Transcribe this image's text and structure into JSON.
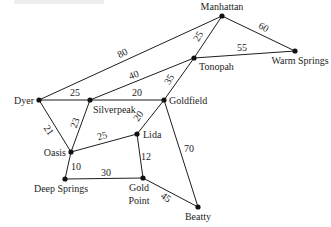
{
  "diagram": {
    "type": "weighted-undirected-graph",
    "nodes": [
      {
        "id": "manhattan",
        "label": "Manhattan",
        "x": 222,
        "y": 16,
        "lx": 222,
        "ly": 10,
        "anchor": "middle"
      },
      {
        "id": "tonopah",
        "label": "Tonopah",
        "x": 194,
        "y": 58,
        "lx": 199,
        "ly": 70,
        "anchor": "start"
      },
      {
        "id": "warm-springs",
        "label": "Warm Springs",
        "x": 295,
        "y": 51,
        "lx": 300,
        "ly": 64,
        "anchor": "middle"
      },
      {
        "id": "dyer",
        "label": "Dyer",
        "x": 39,
        "y": 100,
        "lx": 34,
        "ly": 104,
        "anchor": "end"
      },
      {
        "id": "silverpeak",
        "label": "Silverpeak",
        "x": 90,
        "y": 100,
        "lx": 93,
        "ly": 113,
        "anchor": "start"
      },
      {
        "id": "goldfield",
        "label": "Goldfield",
        "x": 164,
        "y": 100,
        "lx": 169,
        "ly": 104,
        "anchor": "start"
      },
      {
        "id": "lida",
        "label": "Lida",
        "x": 137,
        "y": 134,
        "lx": 143,
        "ly": 138,
        "anchor": "start"
      },
      {
        "id": "oasis",
        "label": "Oasis",
        "x": 71,
        "y": 152,
        "lx": 66,
        "ly": 156,
        "anchor": "end"
      },
      {
        "id": "deep-springs",
        "label": "Deep Springs",
        "x": 65,
        "y": 179,
        "lx": 61,
        "ly": 192,
        "anchor": "middle"
      },
      {
        "id": "gold-point",
        "label": "Gold",
        "label2": "Point",
        "x": 143,
        "y": 178,
        "lx": 139,
        "ly": 191,
        "lx2": 139,
        "ly2": 204,
        "anchor": "middle"
      },
      {
        "id": "beatty",
        "label": "Beatty",
        "x": 198,
        "y": 207,
        "lx": 198,
        "ly": 220,
        "anchor": "middle"
      }
    ],
    "edges": [
      {
        "from": "dyer",
        "to": "manhattan",
        "weight": "80",
        "wx": 124,
        "wy": 56,
        "rot": -28
      },
      {
        "from": "silverpeak",
        "to": "tonopah",
        "weight": "40",
        "wx": 135,
        "wy": 78,
        "rot": -22
      },
      {
        "from": "dyer",
        "to": "silverpeak",
        "weight": "25",
        "wx": 75,
        "wy": 96,
        "rot": 0
      },
      {
        "from": "silverpeak",
        "to": "goldfield",
        "weight": "20",
        "wx": 137,
        "wy": 96,
        "rot": 0
      },
      {
        "from": "manhattan",
        "to": "tonopah",
        "weight": "25",
        "wx": 201,
        "wy": 38,
        "rot": -60
      },
      {
        "from": "manhattan",
        "to": "warm-springs",
        "weight": "60",
        "wx": 262,
        "wy": 30,
        "rot": 30
      },
      {
        "from": "tonopah",
        "to": "warm-springs",
        "weight": "55",
        "wx": 242,
        "wy": 51,
        "rot": 0
      },
      {
        "from": "tonopah",
        "to": "goldfield",
        "weight": "35",
        "wx": 172,
        "wy": 81,
        "rot": -60
      },
      {
        "from": "dyer",
        "to": "oasis",
        "weight": "21",
        "wx": 46,
        "wy": 132,
        "rot": 55
      },
      {
        "from": "silverpeak",
        "to": "oasis",
        "weight": "23",
        "wx": 78,
        "wy": 124,
        "rot": -70
      },
      {
        "from": "oasis",
        "to": "lida",
        "weight": "25",
        "wx": 103,
        "wy": 139,
        "rot": -15
      },
      {
        "from": "goldfield",
        "to": "lida",
        "weight": "20",
        "wx": 141,
        "wy": 118,
        "rot": -55
      },
      {
        "from": "goldfield",
        "to": "beatty",
        "weight": "70",
        "wx": 189,
        "wy": 152,
        "rot": 0
      },
      {
        "from": "lida",
        "to": "gold-point",
        "weight": "12",
        "wx": 146,
        "wy": 160,
        "rot": 0
      },
      {
        "from": "oasis",
        "to": "deep-springs",
        "weight": "10",
        "wx": 76,
        "wy": 170,
        "rot": 0
      },
      {
        "from": "deep-springs",
        "to": "gold-point",
        "weight": "30",
        "wx": 106,
        "wy": 176,
        "rot": 0
      },
      {
        "from": "gold-point",
        "to": "beatty",
        "weight": "45",
        "wx": 164,
        "wy": 200,
        "rot": 35
      }
    ]
  }
}
